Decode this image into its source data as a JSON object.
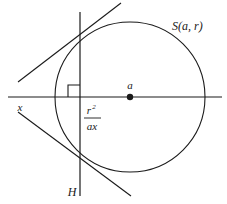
{
  "figure": {
    "background_color": "#ffffff",
    "stroke_color": "#1a1a1a",
    "labels": {
      "sphere": "S(a, r)",
      "center_point": "a",
      "external_point": "x",
      "hyperplane": "H",
      "distance_numerator": "r",
      "distance_numerator_exponent": "2",
      "distance_denominator": "ax"
    },
    "geometry": {
      "circle": {
        "cx": 130,
        "cy": 97,
        "r": 75
      },
      "center_dot": {
        "cx": 130,
        "cy": 97,
        "r": 3
      },
      "horizontal_axis": {
        "x1": 8,
        "y1": 97,
        "x2": 222,
        "y2": 97
      },
      "vertical_line_H": {
        "x1": 80,
        "y1": 12,
        "x2": 80,
        "y2": 196
      },
      "tangent_upper": {
        "x1": 18,
        "y1": 82,
        "x2": 121,
        "y2": 3
      },
      "tangent_lower": {
        "x1": 18,
        "y1": 112,
        "x2": 131,
        "y2": 196
      },
      "right_angle_mark": {
        "x": 68,
        "y": 85,
        "size": 12
      },
      "tangent_point_upper": {
        "x": 80,
        "y": 42
      },
      "tangent_point_lower": {
        "x": 80,
        "y": 152
      },
      "external_point_xy": {
        "x": 22,
        "y": 97
      }
    },
    "label_positions": {
      "sphere": {
        "x": 172,
        "y": 30
      },
      "center_point": {
        "x": 130,
        "y": 88
      },
      "external_point": {
        "x": 20,
        "y": 110
      },
      "hyperplane": {
        "x": 71,
        "y": 193
      },
      "fraction_numerator": {
        "x": 90,
        "y": 112
      },
      "fraction_denominator": {
        "x": 88,
        "y": 128
      },
      "fraction_bar": {
        "x1": 85,
        "y1": 116,
        "x2": 100,
        "y2": 116
      }
    }
  }
}
